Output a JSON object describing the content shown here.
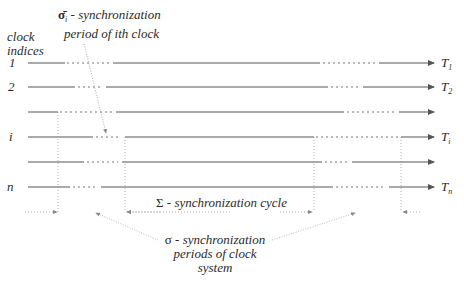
{
  "axis_label": {
    "line1": "clock",
    "line2": "indices"
  },
  "clock_indices": [
    "1",
    "2",
    "",
    "i",
    "",
    "n"
  ],
  "clock_targets": [
    {
      "name": "T",
      "sub": "1"
    },
    {
      "name": "T",
      "sub": "2"
    },
    {
      "name": "",
      "sub": ""
    },
    {
      "name": "T",
      "sub": "i"
    },
    {
      "name": "",
      "sub": ""
    },
    {
      "name": "T",
      "sub": "n"
    }
  ],
  "annotations": {
    "sigma_i": {
      "symbol": "σ̄",
      "sub": "i",
      "text1": " - synchronization",
      "text2": "period of ith clock"
    },
    "Sigma": {
      "symbol": "Σ",
      "text": " - synchronization cycle"
    },
    "sigma": {
      "symbol": "σ",
      "text1": " - synchronization",
      "text2": "periods of clock",
      "text3": "system"
    }
  },
  "colors": {
    "line": "#555555",
    "dotted": "#777777",
    "pointer": "#999999"
  }
}
